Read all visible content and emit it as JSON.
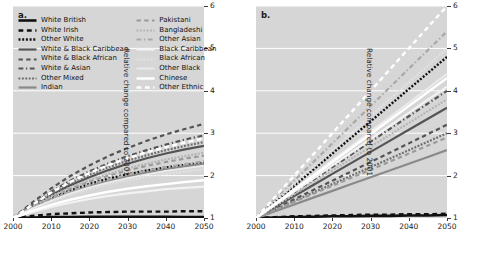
{
  "figure": {
    "panels": [
      {
        "letter": "a.",
        "name": "panel-a"
      },
      {
        "letter": "b.",
        "name": "panel-b"
      }
    ],
    "ylabel": "Relative change compared to 2001",
    "xlabel": "",
    "yticks": [
      "1",
      "2",
      "3",
      "4",
      "5",
      "6"
    ],
    "xticks": [
      "2000",
      "2010",
      "2020",
      "2030",
      "2040",
      "2050"
    ]
  },
  "legend": {
    "left_column": [
      {
        "label": "White British",
        "style": "solid",
        "color": "#111111",
        "width": 2.6
      },
      {
        "label": "White Irish",
        "style": "dashed",
        "color": "#111111",
        "width": 2.4
      },
      {
        "label": "Other White",
        "style": "dotted",
        "color": "#111111",
        "width": 2.4
      },
      {
        "label": "White & Black Caribbean",
        "style": "solid",
        "color": "#545454",
        "width": 2.2
      },
      {
        "label": "White & Black African",
        "style": "dashed",
        "color": "#545454",
        "width": 2.2
      },
      {
        "label": "White & Asian",
        "style": "dashdot",
        "color": "#545454",
        "width": 2.2
      },
      {
        "label": "Other Mixed",
        "style": "dotted",
        "color": "#6e6e6e",
        "width": 2.2
      },
      {
        "label": "Indian",
        "style": "solid",
        "color": "#8a8a8a",
        "width": 2.2
      }
    ],
    "right_column": [
      {
        "label": "Pakistani",
        "style": "dashed",
        "color": "#9a9a9a",
        "width": 2.2
      },
      {
        "label": "Bangladeshi",
        "style": "dotted",
        "color": "#b4b4b4",
        "width": 2.2
      },
      {
        "label": "Other Asian",
        "style": "dashdot",
        "color": "#a8a8a8",
        "width": 2.2
      },
      {
        "label": "Black Caribbean",
        "style": "solid",
        "color": "#f2f2f2",
        "width": 2.2
      },
      {
        "label": "Black African",
        "style": "dotted",
        "color": "#e2e2e2",
        "width": 2.2
      },
      {
        "label": "Other Black",
        "style": "solid",
        "color": "#ebebeb",
        "width": 1.8
      },
      {
        "label": "Chinese",
        "style": "solid",
        "color": "#ffffff",
        "width": 2.4
      },
      {
        "label": "Other Ethnic",
        "style": "dashed",
        "color": "#ffffff",
        "width": 2.4
      }
    ]
  },
  "chart_data": {
    "type": "line",
    "title": "",
    "xlabel": "",
    "ylabel": "Relative change compared to 2001",
    "xlim": [
      2000,
      2050
    ],
    "ylim": [
      1,
      6
    ],
    "grid": true,
    "legend_position": "upper-left",
    "x": [
      2000,
      2005,
      2010,
      2015,
      2020,
      2025,
      2030,
      2035,
      2040,
      2045,
      2050
    ],
    "panels": [
      {
        "letter": "a.",
        "series": [
          {
            "name": "White British",
            "values": [
              1.0,
              1.01,
              1.02,
              1.02,
              1.03,
              1.03,
              1.03,
              1.03,
              1.03,
              1.02,
              1.02
            ]
          },
          {
            "name": "White Irish",
            "values": [
              1.0,
              1.05,
              1.09,
              1.11,
              1.13,
              1.14,
              1.15,
              1.15,
              1.15,
              1.16,
              1.16
            ]
          },
          {
            "name": "Other White",
            "values": [
              1.0,
              1.25,
              1.47,
              1.65,
              1.8,
              1.93,
              2.03,
              2.12,
              2.19,
              2.25,
              2.3
            ]
          },
          {
            "name": "White & Black Caribbean",
            "values": [
              1.0,
              1.28,
              1.54,
              1.77,
              1.96,
              2.13,
              2.28,
              2.41,
              2.52,
              2.62,
              2.7
            ]
          },
          {
            "name": "White & Black African",
            "values": [
              1.0,
              1.36,
              1.7,
              1.99,
              2.24,
              2.46,
              2.65,
              2.82,
              2.97,
              3.1,
              3.22
            ]
          },
          {
            "name": "White & Asian",
            "values": [
              1.0,
              1.32,
              1.62,
              1.88,
              2.1,
              2.29,
              2.46,
              2.6,
              2.73,
              2.85,
              2.95
            ]
          },
          {
            "name": "Other Mixed",
            "values": [
              1.0,
              1.3,
              1.58,
              1.82,
              2.02,
              2.2,
              2.35,
              2.48,
              2.6,
              2.7,
              2.79
            ]
          },
          {
            "name": "Indian",
            "values": [
              1.0,
              1.23,
              1.43,
              1.6,
              1.75,
              1.87,
              1.98,
              2.07,
              2.15,
              2.22,
              2.28
            ]
          },
          {
            "name": "Pakistani",
            "values": [
              1.0,
              1.26,
              1.49,
              1.69,
              1.86,
              2.0,
              2.12,
              2.23,
              2.32,
              2.4,
              2.47
            ]
          },
          {
            "name": "Bangladeshi",
            "values": [
              1.0,
              1.27,
              1.51,
              1.72,
              1.89,
              2.04,
              2.17,
              2.28,
              2.38,
              2.46,
              2.54
            ]
          },
          {
            "name": "Other Asian",
            "values": [
              1.0,
              1.24,
              1.45,
              1.63,
              1.78,
              1.91,
              2.02,
              2.12,
              2.2,
              2.27,
              2.34
            ]
          },
          {
            "name": "Black Caribbean",
            "values": [
              1.0,
              1.14,
              1.26,
              1.36,
              1.45,
              1.52,
              1.58,
              1.63,
              1.68,
              1.71,
              1.74
            ]
          },
          {
            "name": "Black African",
            "values": [
              1.0,
              1.21,
              1.39,
              1.55,
              1.68,
              1.79,
              1.89,
              1.97,
              2.04,
              2.1,
              2.15
            ]
          },
          {
            "name": "Other Black",
            "values": [
              1.0,
              1.22,
              1.41,
              1.58,
              1.72,
              1.84,
              1.94,
              2.03,
              2.11,
              2.17,
              2.23
            ]
          },
          {
            "name": "Chinese",
            "values": [
              1.0,
              1.17,
              1.31,
              1.43,
              1.53,
              1.62,
              1.69,
              1.75,
              1.8,
              1.85,
              1.89
            ]
          },
          {
            "name": "Other Ethnic",
            "values": [
              1.0,
              1.31,
              1.6,
              1.85,
              2.06,
              2.25,
              2.41,
              2.55,
              2.67,
              2.78,
              2.88
            ]
          }
        ]
      },
      {
        "letter": "b.",
        "series": [
          {
            "name": "White British",
            "values": [
              1.0,
              1.01,
              1.02,
              1.03,
              1.04,
              1.04,
              1.05,
              1.05,
              1.06,
              1.06,
              1.07
            ]
          },
          {
            "name": "White Irish",
            "values": [
              1.0,
              1.02,
              1.04,
              1.05,
              1.06,
              1.07,
              1.08,
              1.08,
              1.09,
              1.09,
              1.1
            ]
          },
          {
            "name": "Other White",
            "values": [
              1.0,
              1.38,
              1.76,
              2.14,
              2.52,
              2.9,
              3.28,
              3.66,
              4.04,
              4.42,
              4.8
            ]
          },
          {
            "name": "White & Black Caribbean",
            "values": [
              1.0,
              1.26,
              1.52,
              1.78,
              2.04,
              2.3,
              2.56,
              2.82,
              3.08,
              3.34,
              3.6
            ]
          },
          {
            "name": "White & Black African",
            "values": [
              1.0,
              1.22,
              1.44,
              1.66,
              1.88,
              2.1,
              2.32,
              2.54,
              2.76,
              2.98,
              3.2
            ]
          },
          {
            "name": "White & Asian",
            "values": [
              1.0,
              1.3,
              1.6,
              1.9,
              2.2,
              2.5,
              2.8,
              3.1,
              3.4,
              3.7,
              4.0
            ]
          },
          {
            "name": "Other Mixed",
            "values": [
              1.0,
              1.2,
              1.4,
              1.6,
              1.8,
              2.0,
              2.2,
              2.4,
              2.6,
              2.8,
              3.0
            ]
          },
          {
            "name": "Indian",
            "values": [
              1.0,
              1.16,
              1.32,
              1.48,
              1.64,
              1.8,
              1.96,
              2.12,
              2.28,
              2.44,
              2.6
            ]
          },
          {
            "name": "Pakistani",
            "values": [
              1.0,
              1.19,
              1.38,
              1.57,
              1.76,
              1.95,
              2.14,
              2.33,
              2.52,
              2.71,
              2.9
            ]
          },
          {
            "name": "Bangladeshi",
            "values": [
              1.0,
              1.28,
              1.56,
              1.84,
              2.12,
              2.4,
              2.68,
              2.96,
              3.24,
              3.52,
              3.8
            ]
          },
          {
            "name": "Other Asian",
            "values": [
              1.0,
              1.44,
              1.88,
              2.32,
              2.76,
              3.2,
              3.64,
              4.08,
              4.52,
              4.96,
              5.4
            ]
          },
          {
            "name": "Black Caribbean",
            "values": [
              1.0,
              1.31,
              1.62,
              1.93,
              2.24,
              2.55,
              2.86,
              3.17,
              3.48,
              3.79,
              4.1
            ]
          },
          {
            "name": "Black African",
            "values": [
              1.0,
              1.4,
              1.8,
              2.2,
              2.6,
              3.0,
              3.4,
              3.8,
              4.2,
              4.6,
              5.0
            ]
          },
          {
            "name": "Other Black",
            "values": [
              1.0,
              1.34,
              1.68,
              2.02,
              2.36,
              2.7,
              3.04,
              3.38,
              3.72,
              4.06,
              4.4
            ]
          },
          {
            "name": "Chinese",
            "values": [
              1.0,
              1.33,
              1.66,
              1.99,
              2.32,
              2.65,
              2.98,
              3.31,
              3.64,
              3.97,
              4.3
            ]
          },
          {
            "name": "Other Ethnic",
            "values": [
              1.0,
              1.5,
              2.0,
              2.5,
              3.0,
              3.5,
              4.0,
              4.5,
              5.0,
              5.5,
              6.0
            ]
          }
        ]
      }
    ]
  }
}
